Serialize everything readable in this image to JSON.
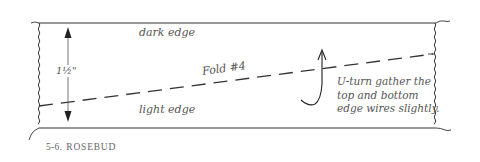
{
  "figure": {
    "caption_number": "5-6.",
    "caption_title": "ROSEBUD"
  },
  "labels": {
    "top_edge": "dark edge",
    "bottom_edge": "light edge",
    "fold": "Fold #4",
    "height_measure": "1½\"",
    "instruction": "U-turn gather the top and bottom edge wires slightly."
  },
  "colors": {
    "line": "#333333",
    "text": "#555555",
    "background": "#ffffff"
  }
}
